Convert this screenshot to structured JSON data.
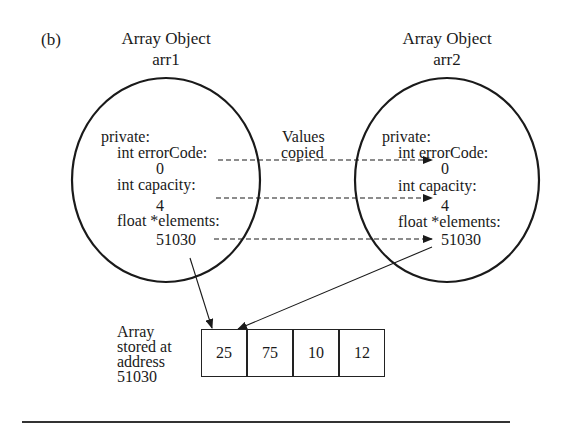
{
  "figure": {
    "label": "(b)"
  },
  "left_object": {
    "title": "Array Object",
    "name": "arr1",
    "section": "private:",
    "fields": [
      {
        "decl": "int errorCode:",
        "value": "0"
      },
      {
        "decl": "int capacity:",
        "value": "4"
      },
      {
        "decl": "float *elements:",
        "value": "51030"
      }
    ]
  },
  "right_object": {
    "title": "Array Object",
    "name": "arr2",
    "section": "private:",
    "fields": [
      {
        "decl": "int errorCode:",
        "value": "0"
      },
      {
        "decl": "int capacity:",
        "value": "4"
      },
      {
        "decl": "float *elements:",
        "value": "51030"
      }
    ]
  },
  "copy_annotation": {
    "line1": "Values",
    "line2": "copied"
  },
  "array": {
    "label_lines": [
      "Array",
      "stored at",
      "address",
      "51030"
    ],
    "values": [
      "25",
      "75",
      "10",
      "12"
    ]
  },
  "colors": {
    "ink": "#1a1a1a",
    "background": "#ffffff"
  }
}
